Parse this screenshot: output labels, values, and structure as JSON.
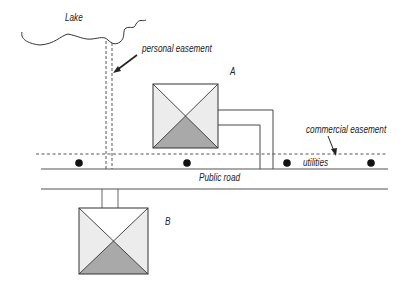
{
  "diagram": {
    "labels": {
      "lake": "Lake",
      "personal_easement": "personal easement",
      "house_a": "A",
      "house_b": "B",
      "commercial_easement": "commercial easement",
      "utilities": "utilities",
      "public_road": "Public road"
    },
    "colors": {
      "line": "#333333",
      "house_light": "#ececec",
      "house_dark": "#a9a9a9",
      "background": "#ffffff"
    }
  }
}
